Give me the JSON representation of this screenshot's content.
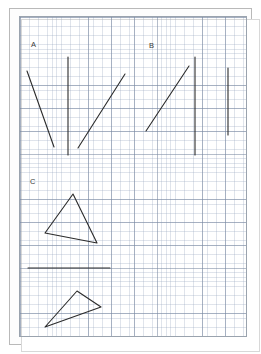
{
  "document": {
    "kind": "graph-paper-worksheet",
    "title": "Graph paper sketch with line segments and triangles",
    "paper_background": "#ffffff",
    "grid": {
      "minor_spacing_px": 4.56,
      "major_spacing_px": 22.8,
      "minor_color": "#96a5be",
      "major_color": "#7887a0",
      "border_color": "#9aa3ae"
    },
    "frame": {
      "outer_color": "#b9b9b9",
      "inner_color": "#d8d8d8"
    }
  },
  "ink": {
    "color": "#2b2b2b",
    "stroke_width": 1.1
  },
  "labels": {
    "a": "A",
    "b": "B",
    "c": "C"
  },
  "figures": {
    "section_a": {
      "name": "A",
      "strokes": [
        {
          "name": "segment-a1",
          "type": "line",
          "x1": 27,
          "y1": 71,
          "x2": 54,
          "y2": 147
        },
        {
          "name": "segment-a2",
          "type": "line",
          "x1": 68,
          "y1": 57,
          "x2": 68,
          "y2": 155
        },
        {
          "name": "segment-a3",
          "type": "line",
          "x1": 78,
          "y1": 148,
          "x2": 125,
          "y2": 74
        }
      ]
    },
    "section_b": {
      "name": "B",
      "strokes": [
        {
          "name": "segment-b1",
          "type": "line",
          "x1": 146,
          "y1": 131,
          "x2": 189,
          "y2": 66
        },
        {
          "name": "segment-b2",
          "type": "line",
          "x1": 195,
          "y1": 57,
          "x2": 195,
          "y2": 155
        },
        {
          "name": "segment-b3",
          "type": "line",
          "x1": 228,
          "y1": 68,
          "x2": 228,
          "y2": 135
        }
      ]
    },
    "section_c": {
      "name": "C",
      "strokes": [
        {
          "name": "triangle-c1",
          "type": "polygon",
          "points": "73,194 97,243 45,233"
        },
        {
          "name": "segment-c-horizontal",
          "type": "line",
          "x1": 28,
          "y1": 268,
          "x2": 110,
          "y2": 268
        },
        {
          "name": "triangle-c2",
          "type": "polygon",
          "points": "77,291 101,307 45,327"
        }
      ]
    }
  }
}
